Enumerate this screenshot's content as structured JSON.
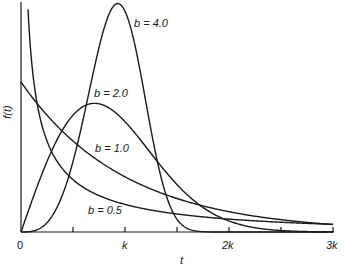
{
  "chart_data": {
    "type": "line",
    "title": "",
    "xlabel": "t",
    "ylabel": "f(t)",
    "x_ticks": [
      "0",
      "k",
      "2k",
      "3k"
    ],
    "x_minor_ticks": [
      0.5,
      1.5,
      2.5
    ],
    "xlim": [
      0,
      3
    ],
    "x_unit": "k",
    "grid": false,
    "legend": "inline labels",
    "series": [
      {
        "name": "b = 0.5",
        "b": 0.5,
        "label": "b = 0.5",
        "peak_t": 0,
        "behavior": "diverges at t=0, decreasing"
      },
      {
        "name": "b = 1.0",
        "b": 1.0,
        "label": "b = 1.0",
        "value_at_0": 1.0,
        "behavior": "exponential decay from 1/k"
      },
      {
        "name": "b = 2.0",
        "b": 2.0,
        "label": "b = 2.0",
        "peak_t": 0.71,
        "peak_f": 0.86
      },
      {
        "name": "b = 4.0",
        "b": 4.0,
        "label": "b = 4.0",
        "peak_t": 0.93,
        "peak_f": 1.52
      }
    ]
  },
  "labels": {
    "b05": "b = 0.5",
    "b10": "b = 1.0",
    "b20": "b = 2.0",
    "b40": "b = 4.0",
    "x_axis": "t",
    "y_axis": "f(t)",
    "tick0": "0",
    "tick1": "k",
    "tick2": "2k",
    "tick3": "3k"
  },
  "layout": {
    "x0": 21,
    "xk": 104,
    "y0": 232,
    "yunit": 150,
    "ytop": 2
  }
}
